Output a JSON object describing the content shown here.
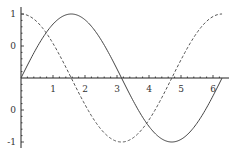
{
  "chart_data": {
    "type": "line",
    "title": "",
    "xlabel": "",
    "ylabel": "",
    "xlim": [
      0,
      6.2832
    ],
    "ylim": [
      -1,
      1
    ],
    "grid": false,
    "legend": null,
    "x_ticks": [
      {
        "value": 1,
        "label": "1"
      },
      {
        "value": 2,
        "label": "2"
      },
      {
        "value": 3,
        "label": "3"
      },
      {
        "value": 4,
        "label": "4"
      },
      {
        "value": 5,
        "label": "5"
      },
      {
        "value": 6,
        "label": "6"
      }
    ],
    "y_ticks": [
      {
        "value": 1,
        "label": "1"
      },
      {
        "value": 0.5,
        "label": "0"
      },
      {
        "value": -0.5,
        "label": "0"
      },
      {
        "value": -1,
        "label": "-1"
      }
    ],
    "series": [
      {
        "name": "sin(x)",
        "style": "solid",
        "x": [
          0,
          0.5,
          1,
          1.5708,
          2,
          2.5,
          3,
          3.1416,
          3.5,
          4,
          4.5,
          4.7124,
          5,
          5.5,
          6,
          6.2832
        ],
        "values": [
          0,
          0.479,
          0.841,
          1,
          0.909,
          0.598,
          0.141,
          0,
          -0.351,
          -0.757,
          -0.978,
          -1,
          -0.959,
          -0.706,
          -0.279,
          0
        ]
      },
      {
        "name": "cos(x)",
        "style": "dashed",
        "x": [
          0,
          0.5,
          1,
          1.5708,
          2,
          2.5,
          3,
          3.1416,
          3.5,
          4,
          4.5,
          4.7124,
          5,
          5.5,
          6,
          6.2832
        ],
        "values": [
          1,
          0.878,
          0.54,
          0,
          -0.416,
          -0.801,
          -0.99,
          -1,
          -0.936,
          -0.654,
          -0.211,
          0,
          0.284,
          0.709,
          0.96,
          1
        ]
      }
    ]
  }
}
